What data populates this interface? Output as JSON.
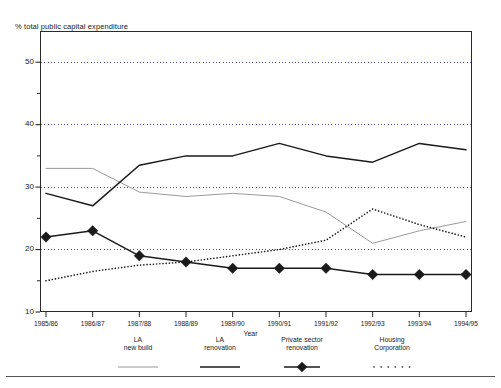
{
  "chart_data": {
    "type": "line",
    "title": "",
    "ylabel": "% total public capital expenditure",
    "xlabel": "Year",
    "ylim": [
      10,
      55
    ],
    "yticks": [
      10,
      20,
      30,
      40,
      50
    ],
    "ytick_labels": [
      "10",
      "20",
      "30",
      "40",
      "50"
    ],
    "minor_yticks": [
      15,
      25,
      35,
      45
    ],
    "grid": "horizontal dotted at 20, 30, 40, 50",
    "legend_position": "below-axes",
    "categories": [
      "1985/86",
      "1986/87",
      "1987/88",
      "1988/89",
      "1989/90",
      "1990/91",
      "1991/92",
      "1992/93",
      "1993/94",
      "1994/95"
    ],
    "series": [
      {
        "name": "LA\nnew build",
        "label_line1": "LA",
        "label_line2": "new build",
        "style": "solid-thin-grey",
        "color": "#9a9a9a",
        "marker": "none",
        "values": [
          33,
          33,
          29.2,
          28.5,
          29,
          28.5,
          26,
          21,
          23,
          24.5
        ]
      },
      {
        "name": "LA\nrenovation",
        "label_line1": "LA",
        "label_line2": "renovation",
        "style": "solid-black",
        "color": "#1a1a1a",
        "marker": "none",
        "values": [
          29,
          27,
          33.5,
          35,
          35,
          37,
          35,
          34,
          37,
          36
        ]
      },
      {
        "name": "Private sector\nrenovation",
        "label_line1": "Private sector",
        "label_line2": "renovation",
        "style": "solid-black-diamond",
        "color": "#1a1a1a",
        "marker": "diamond",
        "values": [
          22,
          23,
          19,
          18,
          17,
          17,
          17,
          16,
          16,
          16
        ]
      },
      {
        "name": "Housing\nCorporation",
        "label_line1": "Housing",
        "label_line2": "Corporation",
        "style": "dotted",
        "color": "#1a1a1a",
        "marker": "none",
        "values": [
          15,
          16.5,
          17.5,
          18,
          19,
          20,
          21.5,
          26.5,
          24,
          22
        ]
      }
    ]
  },
  "axis": {
    "y_title": "% total public capital expenditure",
    "x_title": "Year",
    "y_labels": [
      "50",
      "40",
      "30",
      "20",
      "10"
    ],
    "x_labels": [
      "1985/86",
      "1986/87",
      "1987/88",
      "1988/89",
      "1989/90",
      "1990/91",
      "1991/92",
      "1992/93",
      "1993/94",
      "1994/95"
    ]
  },
  "legend": {
    "items": [
      {
        "line1": "LA",
        "line2": "new build",
        "swatch": "grey-line-icon"
      },
      {
        "line1": "LA",
        "line2": "renovation",
        "swatch": "black-line-icon"
      },
      {
        "line1": "Private sector",
        "line2": "renovation",
        "swatch": "diamond-marker-icon"
      },
      {
        "line1": "Housing",
        "line2": "Corporation",
        "swatch": "dotted-line-icon"
      }
    ]
  },
  "colors": {
    "grey_series": "#9a9a9a",
    "black_series": "#1a1a1a",
    "frame": "#2a2a2a",
    "grid": "#33339a",
    "background": "#ffffff"
  }
}
